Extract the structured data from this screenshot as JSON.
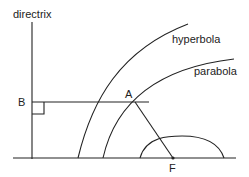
{
  "diagram": {
    "labels": {
      "directrix": "directrix",
      "hyperbola": "hyperbola",
      "parabola": "parabola",
      "point_b": "B",
      "point_a": "A",
      "focus": "F"
    },
    "colors": {
      "stroke": "#222222",
      "background": "#ffffff"
    }
  }
}
